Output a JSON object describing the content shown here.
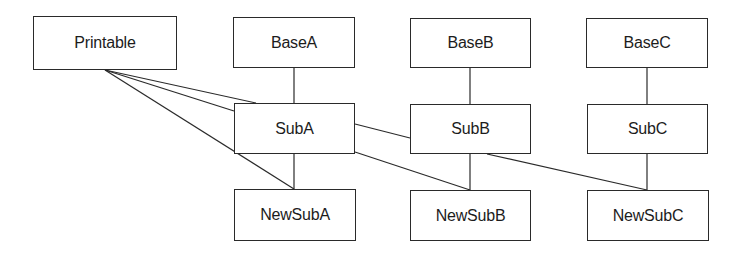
{
  "diagram": {
    "type": "class-hierarchy",
    "nodes": [
      {
        "id": "printable",
        "label": "Printable",
        "x": 33,
        "y": 16,
        "w": 144,
        "h": 54
      },
      {
        "id": "baseA",
        "label": "BaseA",
        "x": 233,
        "y": 17,
        "w": 122,
        "h": 51
      },
      {
        "id": "baseB",
        "label": "BaseB",
        "x": 410,
        "y": 18,
        "w": 121,
        "h": 50
      },
      {
        "id": "baseC",
        "label": "BaseC",
        "x": 586,
        "y": 18,
        "w": 122,
        "h": 50
      },
      {
        "id": "subA",
        "label": "SubA",
        "x": 234,
        "y": 103,
        "w": 121,
        "h": 51
      },
      {
        "id": "subB",
        "label": "SubB",
        "x": 410,
        "y": 104,
        "w": 121,
        "h": 50
      },
      {
        "id": "subC",
        "label": "SubC",
        "x": 587,
        "y": 104,
        "w": 121,
        "h": 50
      },
      {
        "id": "newSubA",
        "label": "NewSubA",
        "x": 234,
        "y": 189,
        "w": 122,
        "h": 52
      },
      {
        "id": "newSubB",
        "label": "NewSubB",
        "x": 410,
        "y": 190,
        "w": 121,
        "h": 51
      },
      {
        "id": "newSubC",
        "label": "NewSubC",
        "x": 587,
        "y": 190,
        "w": 122,
        "h": 51
      }
    ],
    "edges": [
      {
        "from": "printable",
        "to": "subA",
        "x1": 105,
        "y1": 70,
        "x2": 256,
        "y2": 103
      },
      {
        "from": "printable",
        "to": "subA",
        "x1": 105,
        "y1": 70,
        "x2": 234,
        "y2": 111
      },
      {
        "from": "printable",
        "to": "newSubA",
        "x1": 105,
        "y1": 70,
        "x2": 294,
        "y2": 189
      },
      {
        "from": "baseA",
        "to": "subA",
        "x1": 294,
        "y1": 68,
        "x2": 294,
        "y2": 103
      },
      {
        "from": "baseB",
        "to": "subB",
        "x1": 470,
        "y1": 68,
        "x2": 470,
        "y2": 104
      },
      {
        "from": "baseC",
        "to": "subC",
        "x1": 647,
        "y1": 68,
        "x2": 647,
        "y2": 104
      },
      {
        "from": "subA",
        "to": "newSubA",
        "x1": 294,
        "y1": 154,
        "x2": 294,
        "y2": 189
      },
      {
        "from": "subA",
        "to": "subB",
        "x1": 355,
        "y1": 124,
        "x2": 410,
        "y2": 138
      },
      {
        "from": "subA",
        "to": "newSubB",
        "x1": 355,
        "y1": 152,
        "x2": 470,
        "y2": 190
      },
      {
        "from": "subB",
        "to": "newSubB",
        "x1": 470,
        "y1": 154,
        "x2": 470,
        "y2": 190
      },
      {
        "from": "subB",
        "to": "newSubC",
        "x1": 487,
        "y1": 154,
        "x2": 647,
        "y2": 190
      },
      {
        "from": "subC",
        "to": "newSubC",
        "x1": 647,
        "y1": 154,
        "x2": 647,
        "y2": 190
      }
    ]
  }
}
